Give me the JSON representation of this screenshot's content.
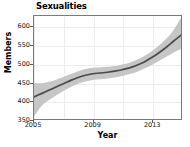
{
  "chart_data": {
    "type": "line",
    "title": "Sexualities",
    "xlabel": "Year",
    "ylabel": "Members",
    "xlim": [
      2005,
      2015
    ],
    "ylim": [
      350,
      630
    ],
    "grid": true,
    "legend": null,
    "yticks": [
      350,
      400,
      450,
      500,
      550,
      600
    ],
    "ytick_labels": [
      "350",
      "400",
      "450",
      "500",
      "550",
      "600"
    ],
    "xticks": [
      2005,
      2009,
      2013
    ],
    "xtick_labels": [
      "2005",
      "2009",
      "2013"
    ],
    "series": [
      {
        "name": "Members",
        "style": "smooth-trend-with-confidence-band",
        "line_color": "#4a4a4a",
        "band_color": "#c6c6c6",
        "x": [
          2005,
          2005.5,
          2006,
          2006.5,
          2007,
          2007.5,
          2008,
          2008.5,
          2009,
          2009.5,
          2010,
          2010.5,
          2011,
          2011.5,
          2012,
          2012.5,
          2013,
          2013.5,
          2014,
          2014.5,
          2015
        ],
        "values": [
          410,
          419,
          428,
          437,
          446,
          455,
          463,
          469,
          473,
          475,
          477,
          480,
          484,
          489,
          496,
          505,
          517,
          530,
          545,
          562,
          578
        ],
        "band_upper": [
          448,
          447,
          451,
          457,
          464,
          472,
          480,
          486,
          489,
          491,
          492,
          494,
          498,
          503,
          511,
          521,
          534,
          550,
          568,
          592,
          625
        ],
        "band_lower": [
          357,
          385,
          401,
          414,
          426,
          437,
          446,
          452,
          456,
          458,
          460,
          463,
          467,
          472,
          478,
          487,
          497,
          508,
          519,
          531,
          540
        ]
      }
    ]
  }
}
